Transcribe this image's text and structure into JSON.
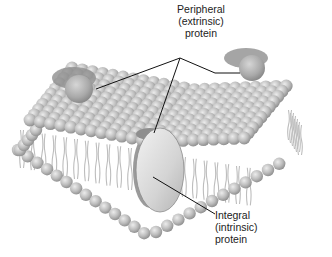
{
  "figure": {
    "colors": {
      "background": "#ffffff",
      "lipid_head": "#b9b9b9",
      "lipid_head_highlight": "#e6e6e6",
      "lipid_head_shadow": "#8c8c8c",
      "lipid_tail": "#c9c9c9",
      "peripheral_protein": "#a4a4a4",
      "integral_protein": "#d8d8d8",
      "leader_line": "#111111",
      "label_text": "#222222"
    }
  },
  "labels": {
    "peripheral": {
      "line1": "Peripheral",
      "line2": "(extrinsic)",
      "line3": "protein"
    },
    "integral": {
      "line1": "Integral",
      "line2": "(intrinsic)",
      "line3": "protein"
    }
  }
}
